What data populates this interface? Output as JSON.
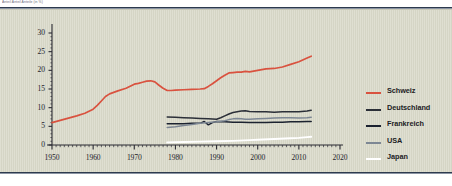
{
  "caption": {
    "text": "Anteil Anteil Anteile  (in %)"
  },
  "chart_data": {
    "type": "line",
    "title": "",
    "xlabel": "",
    "ylabel": "",
    "xlim": [
      1950,
      2020
    ],
    "ylim": [
      0,
      30
    ],
    "grid": false,
    "legend_position": "right",
    "y_ticks": [
      "0",
      "5",
      "10",
      "15",
      "20",
      "25",
      "30"
    ],
    "y_tick_values": [
      0,
      5,
      10,
      15,
      20,
      25,
      30
    ],
    "x_ticks": [
      "1950",
      "1960",
      "1970",
      "1980",
      "1990",
      "2000",
      "2010",
      "2020"
    ],
    "x_tick_values": [
      1950,
      1960,
      1970,
      1980,
      1990,
      2000,
      2010,
      2020
    ],
    "x_minor_step": 1,
    "series": [
      {
        "name": "Schweiz",
        "color": "#d9523f",
        "x": [
          1950,
          1952,
          1954,
          1956,
          1958,
          1960,
          1961,
          1962,
          1963,
          1964,
          1965,
          1966,
          1968,
          1970,
          1971,
          1972,
          1973,
          1974,
          1975,
          1976,
          1977,
          1978,
          1979,
          1980,
          1982,
          1984,
          1986,
          1987,
          1988,
          1989,
          1990,
          1991,
          1992,
          1993,
          1994,
          1995,
          1996,
          1997,
          1998,
          2000,
          2002,
          2004,
          2006,
          2008,
          2010,
          2012,
          2013
        ],
        "values": [
          6.0,
          6.6,
          7.2,
          7.8,
          8.5,
          9.6,
          10.6,
          11.8,
          13.0,
          13.7,
          14.1,
          14.5,
          15.2,
          16.3,
          16.5,
          16.8,
          17.1,
          17.2,
          16.9,
          16.0,
          15.2,
          14.6,
          14.6,
          14.7,
          14.8,
          14.9,
          15.0,
          15.1,
          15.7,
          16.4,
          17.2,
          18.0,
          18.7,
          19.3,
          19.4,
          19.5,
          19.5,
          19.7,
          19.6,
          20.0,
          20.4,
          20.5,
          20.9,
          21.6,
          22.3,
          23.3,
          23.8
        ]
      },
      {
        "name": "Deutschland",
        "color": "#2b2f38",
        "x": [
          1978,
          1980,
          1982,
          1984,
          1986,
          1988,
          1990,
          1991,
          1992,
          1993,
          1994,
          1995,
          1996,
          1997,
          1998,
          2000,
          2002,
          2004,
          2006,
          2008,
          2010,
          2012,
          2013
        ],
        "values": [
          7.5,
          7.4,
          7.3,
          7.2,
          7.1,
          7.0,
          6.9,
          7.3,
          7.8,
          8.3,
          8.7,
          8.9,
          9.1,
          9.2,
          9.0,
          8.9,
          8.9,
          8.8,
          8.9,
          8.9,
          8.9,
          9.1,
          9.3
        ]
      },
      {
        "name": "Frankreich",
        "color": "#1b2230",
        "x": [
          1978,
          1980,
          1982,
          1984,
          1986,
          1987,
          1988,
          1989,
          1990,
          1992,
          1994,
          1996,
          1998,
          2000,
          2002,
          2004,
          2006,
          2008,
          2010,
          2012,
          2013
        ],
        "values": [
          5.7,
          5.7,
          5.7,
          5.8,
          5.8,
          6.3,
          5.4,
          6.0,
          6.3,
          6.2,
          6.1,
          6.1,
          6.0,
          6.0,
          6.0,
          6.1,
          6.1,
          6.2,
          6.2,
          6.3,
          6.3
        ]
      },
      {
        "name": "USA",
        "color": "#7d8794",
        "x": [
          1978,
          1980,
          1982,
          1984,
          1986,
          1988,
          1990,
          1992,
          1993,
          1994,
          1995,
          1996,
          1997,
          1998,
          2000,
          2002,
          2004,
          2006,
          2008,
          2010,
          2012,
          2013
        ],
        "values": [
          4.7,
          4.9,
          5.2,
          5.5,
          5.8,
          6.0,
          6.2,
          6.5,
          6.8,
          7.0,
          7.1,
          7.0,
          6.9,
          6.9,
          7.0,
          7.1,
          7.2,
          7.3,
          7.3,
          7.2,
          7.3,
          7.4
        ]
      },
      {
        "name": "Japan",
        "color": "#ffffff",
        "x": [
          1978,
          1982,
          1986,
          1990,
          1994,
          1998,
          2000,
          2004,
          2008,
          2010,
          2012,
          2013
        ],
        "values": [
          0.7,
          0.8,
          0.9,
          1.0,
          1.1,
          1.3,
          1.4,
          1.6,
          1.8,
          1.9,
          2.1,
          2.2
        ]
      }
    ]
  },
  "legend": {
    "items": [
      {
        "label": "Schweiz",
        "color": "#d9523f"
      },
      {
        "label": "Deutschland",
        "color": "#2b2f38"
      },
      {
        "label": "Frankreich",
        "color": "#1b2230"
      },
      {
        "label": "USA",
        "color": "#7d8794"
      },
      {
        "label": "Japan",
        "color": "#ffffff"
      }
    ]
  },
  "colors": {
    "panel_background": "#d9d9c9",
    "rule": "#2d3a4e",
    "axis": "#2b2b33",
    "tick_text": "#23232b"
  }
}
